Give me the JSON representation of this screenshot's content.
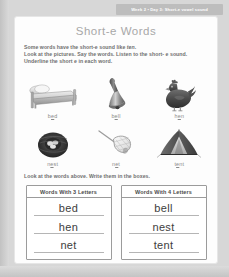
{
  "header": {
    "banner_text": "Week 2 • Day 3: Short-e vowel sound"
  },
  "title": "Short-e Words",
  "instructions": {
    "line1_pre": "Some words have the short-e sound like ",
    "line1_em": "ten",
    "line1_post": ".",
    "line2": "Look at the pictures. Say the words. Listen to the short- e sound.",
    "line3": "Underline the short e in each word."
  },
  "picture_grid": {
    "rows": [
      {
        "cells": [
          {
            "icon": "bed-icon",
            "label_pre": "b",
            "label_e": "e",
            "label_post": "d"
          },
          {
            "icon": "bell-icon",
            "label_pre": "b",
            "label_e": "e",
            "label_post": "ll"
          },
          {
            "icon": "hen-icon",
            "label_pre": "h",
            "label_e": "e",
            "label_post": "n"
          }
        ]
      },
      {
        "cells": [
          {
            "icon": "nest-icon",
            "label_pre": "n",
            "label_e": "e",
            "label_post": "st"
          },
          {
            "icon": "net-icon",
            "label_pre": "n",
            "label_e": "e",
            "label_post": "t"
          },
          {
            "icon": "tent-icon",
            "label_pre": "t",
            "label_e": "e",
            "label_post": "nt"
          }
        ]
      }
    ]
  },
  "write_instruction": "Look at the words above. Write them in the boxes.",
  "answer_boxes": [
    {
      "header": "Words With 3 Letters",
      "lines": [
        "bed",
        "hen",
        "net"
      ]
    },
    {
      "header": "Words With 4 Letters",
      "lines": [
        "bell",
        "nest",
        "tent"
      ]
    }
  ],
  "colors": {
    "page_background": "#d7d7d7",
    "sheet_background": "#fdfdfd",
    "banner": "#bdbdbd",
    "title_text": "#a8a8a8",
    "instruction_text": "#6f6f6f",
    "box_border": "#9b9b9b",
    "answer_text": "#3d3d3d"
  }
}
